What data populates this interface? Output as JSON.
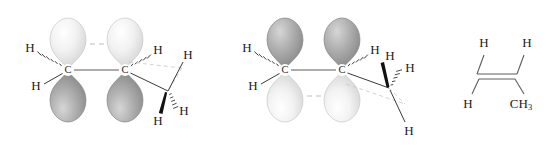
{
  "figure": {
    "background_color": "#ffffff",
    "colors": {
      "lobe_light": "#ededed",
      "lobe_light_edge": "#c9c9c9",
      "lobe_dark": "#9d9d9d",
      "lobe_dark_edge": "#7a7a7a",
      "bond_line": "#5d5d5d",
      "dashed_overlap": "#b9b9b9",
      "text": "#1b1b1b",
      "wedge_solid": "#111111"
    }
  },
  "panels": [
    {
      "id": "panel-1",
      "name": "orbital-structure-left",
      "description": "Propene with p orbitals, light lobes up and dark lobes down",
      "pi_overlap_position": "top",
      "carbons": [
        {
          "name": "alkene-carbon-1",
          "label": "C"
        },
        {
          "name": "alkene-carbon-2",
          "label": "C"
        }
      ],
      "hydrogens": [
        {
          "name": "h-c1-hashed",
          "label": "H",
          "bond": "hashed"
        },
        {
          "name": "h-c1-plain",
          "label": "H",
          "bond": "plain"
        },
        {
          "name": "h-c2-hashed",
          "label": "H",
          "bond": "hashed"
        },
        {
          "name": "h-methyl-plain",
          "label": "H",
          "bond": "plain"
        },
        {
          "name": "h-methyl-wedge",
          "label": "H",
          "bond": "wedge"
        },
        {
          "name": "h-methyl-hashed",
          "label": "H",
          "bond": "hashed"
        }
      ]
    },
    {
      "id": "panel-2",
      "name": "orbital-structure-right",
      "description": "Propene with p orbitals, dark lobes up and light lobes down",
      "pi_overlap_position": "bottom",
      "carbons": [
        {
          "name": "alkene-carbon-1",
          "label": "C"
        },
        {
          "name": "alkene-carbon-2",
          "label": "C"
        }
      ],
      "hydrogens": [
        {
          "name": "h-c1-hashed",
          "label": "H",
          "bond": "hashed"
        },
        {
          "name": "h-c1-plain",
          "label": "H",
          "bond": "plain"
        },
        {
          "name": "h-c2-hashed",
          "label": "H",
          "bond": "hashed"
        },
        {
          "name": "h-methyl-wedge",
          "label": "H",
          "bond": "wedge"
        },
        {
          "name": "h-methyl-hashed",
          "label": "H",
          "bond": "hashed"
        },
        {
          "name": "h-methyl-plain",
          "label": "H",
          "bond": "plain"
        }
      ]
    },
    {
      "id": "panel-3",
      "name": "skeletal-structure",
      "description": "Condensed skeletal structure of propene",
      "bond_type": "double",
      "labels": [
        {
          "name": "h-top-left",
          "text": "H"
        },
        {
          "name": "h-top-right",
          "text": "H"
        },
        {
          "name": "h-bottom-left",
          "text": "H"
        },
        {
          "name": "methyl-group",
          "text": "CH",
          "subscript": "3"
        }
      ]
    }
  ]
}
